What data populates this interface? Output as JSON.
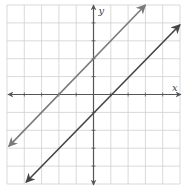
{
  "chart_data": {
    "type": "line",
    "title": "",
    "xlabel": "x",
    "ylabel": "y",
    "xlim": [
      -5,
      5
    ],
    "ylim": [
      -5,
      5
    ],
    "grid": true,
    "tick_step": 1,
    "tick_labels": false,
    "legend": null,
    "series": [
      {
        "name": "upper line",
        "equation": "y = x + 2",
        "slope": 1,
        "intercept": 2,
        "x_intercept": -2,
        "points": [
          [
            -4.9,
            -2.9
          ],
          [
            3,
            5
          ]
        ],
        "color": "#7a7a7a",
        "arrows": "both"
      },
      {
        "name": "lower line",
        "equation": "y = x - 1",
        "slope": 1,
        "intercept": -1,
        "x_intercept": 1,
        "points": [
          [
            -3.9,
            -4.9
          ],
          [
            5,
            3.9
          ]
        ],
        "color": "#444444",
        "arrows": "both"
      }
    ]
  },
  "labels": {
    "x_axis": "x",
    "y_axis": "y"
  },
  "colors": {
    "grid": "#cfcfcf",
    "axis": "#555555",
    "background": "#ffffff"
  }
}
